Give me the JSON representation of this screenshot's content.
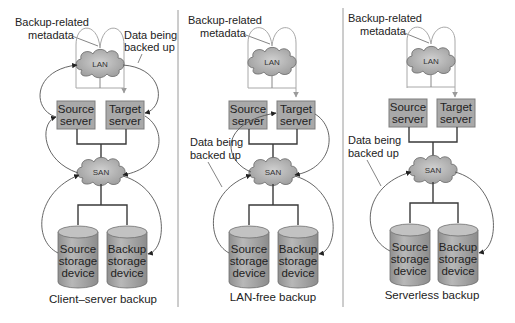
{
  "colors": {
    "server_fill": "#a9a9a9",
    "server_stroke": "#7e7e7e",
    "cloud_fill": "#b4b4b4",
    "cylinder_fill": "#ababab",
    "metadata_line": "#a8a8a8",
    "data_flow_line": "#555555",
    "divider": "#9a9a9a"
  },
  "panels": [
    {
      "id": "client-server",
      "caption": "Client–server backup",
      "metadata_label": [
        "Backup-related",
        "metadata"
      ],
      "data_label": [
        "Data being",
        "backed up"
      ],
      "lan": "LAN",
      "san": "SAN",
      "source_server": [
        "Source",
        "server"
      ],
      "target_server": [
        "Target",
        "server"
      ],
      "source_storage": [
        "Source",
        "storage",
        "device"
      ],
      "backup_storage": [
        "Backup",
        "storage",
        "device"
      ]
    },
    {
      "id": "lan-free",
      "caption": "LAN-free backup",
      "metadata_label": [
        "Backup-related",
        "metadata"
      ],
      "data_label": [
        "Data being",
        "backed up"
      ],
      "lan": "LAN",
      "san": "SAN",
      "source_server": [
        "Source",
        "server"
      ],
      "target_server": [
        "Target",
        "server"
      ],
      "source_storage": [
        "Source",
        "storage",
        "device"
      ],
      "backup_storage": [
        "Backup",
        "storage",
        "device"
      ]
    },
    {
      "id": "serverless",
      "caption": "Serverless backup",
      "metadata_label": [
        "Backup-related",
        "metadata"
      ],
      "data_label": [
        "Data being",
        "backed up"
      ],
      "lan": "LAN",
      "san": "SAN",
      "source_server": [
        "Source",
        "server"
      ],
      "target_server": [
        "Target",
        "server"
      ],
      "source_storage": [
        "Source",
        "storage",
        "device"
      ],
      "backup_storage": [
        "Backup",
        "storage",
        "device"
      ]
    }
  ]
}
